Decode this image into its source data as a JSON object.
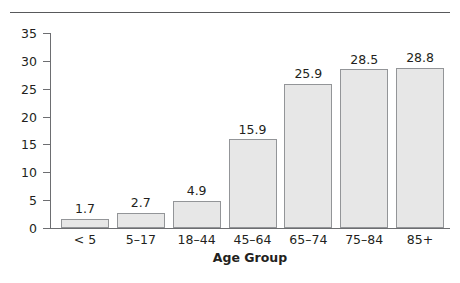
{
  "chart_data": {
    "type": "bar",
    "title": "",
    "xlabel": "Age Group",
    "ylabel": "",
    "categories": [
      "< 5",
      "5–17",
      "18–44",
      "45–64",
      "65–74",
      "75–84",
      "85+"
    ],
    "values": [
      1.7,
      2.7,
      4.9,
      15.9,
      25.9,
      28.5,
      28.8
    ],
    "value_labels": [
      "1.7",
      "2.7",
      "4.9",
      "15.9",
      "25.9",
      "28.5",
      "28.8"
    ],
    "ylim": [
      0,
      35
    ],
    "yticks": [
      0,
      5,
      10,
      15,
      20,
      25,
      30,
      35
    ],
    "ytick_labels": [
      "0",
      "5",
      "10",
      "15",
      "20",
      "25",
      "30",
      "35"
    ],
    "grid": false,
    "legend": null,
    "bar_fill_color": "#e7e7e7",
    "bar_border_color": "#939598",
    "axis_color": "#6d6e71",
    "text_color": "#231f20",
    "background_color": "#ffffff"
  }
}
